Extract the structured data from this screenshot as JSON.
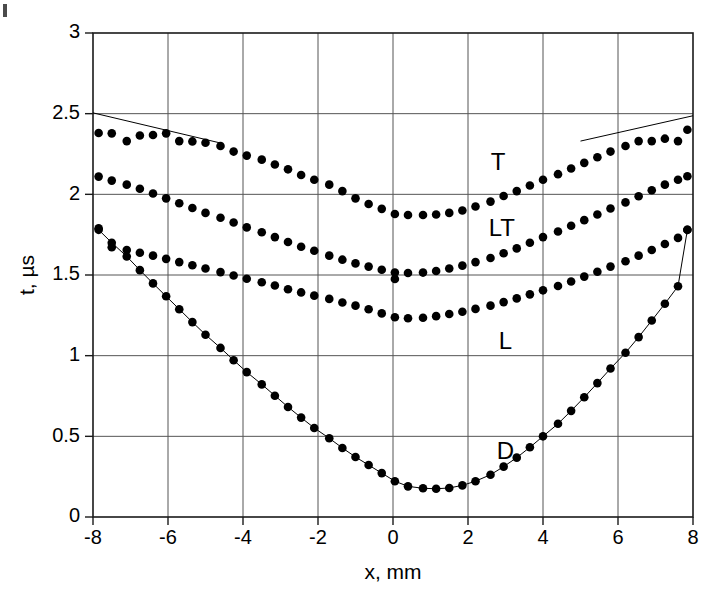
{
  "chart_data": {
    "type": "scatter",
    "title": "",
    "xlabel": "x, mm",
    "ylabel": "t, µs",
    "xlim": [
      -8,
      8
    ],
    "ylim": [
      0,
      3
    ],
    "xticks": [
      -8,
      -6,
      -4,
      -2,
      0,
      2,
      4,
      6,
      8
    ],
    "xtick_labels": [
      "-8",
      "-6",
      "-4",
      "-2",
      "0",
      "2",
      "4",
      "6",
      "8"
    ],
    "yticks": [
      0,
      0.5,
      1,
      1.5,
      2,
      2.5,
      3
    ],
    "ytick_labels": [
      "0",
      "0.5",
      "1",
      "1.5",
      "2",
      "2.5",
      "3"
    ],
    "grid": true,
    "legend": "none",
    "marker": "filled-circle",
    "marker_color": "#000000",
    "line_color": "#000000",
    "annotations": [
      {
        "text": "T",
        "x": 2.8,
        "y": 2.19
      },
      {
        "text": "LT",
        "x": 2.9,
        "y": 1.78
      },
      {
        "text": "L",
        "x": 3.0,
        "y": 1.08
      },
      {
        "text": "D",
        "x": 3.0,
        "y": 0.4
      }
    ],
    "series": [
      {
        "name": "T",
        "label": "T",
        "has_fit_line": true,
        "fit_line_segments": [
          {
            "x": [
              -8.0,
              -4.6
            ],
            "y": [
              2.505,
              2.318
            ]
          },
          {
            "x": [
              5.0,
              8.0
            ],
            "y": [
              2.33,
              2.487
            ]
          }
        ],
        "x": [
          -7.85,
          -7.5,
          -7.1,
          -6.75,
          -6.4,
          -6.05,
          -5.7,
          -5.35,
          -5.0,
          -4.6,
          -4.25,
          -3.9,
          -3.5,
          -3.15,
          -2.8,
          -2.45,
          -2.1,
          -1.7,
          -1.35,
          -1.0,
          -0.65,
          -0.3,
          0.05,
          0.4,
          0.8,
          1.15,
          1.5,
          1.85,
          2.2,
          2.6,
          2.95,
          3.3,
          3.65,
          4.0,
          4.4,
          4.75,
          5.1,
          5.45,
          5.8,
          6.2,
          6.55,
          6.9,
          7.25,
          7.6,
          7.85
        ],
        "y": [
          2.38,
          2.378,
          2.33,
          2.365,
          2.368,
          2.378,
          2.33,
          2.328,
          2.32,
          2.3,
          2.265,
          2.24,
          2.215,
          2.185,
          2.155,
          2.12,
          2.09,
          2.06,
          2.02,
          1.975,
          1.94,
          1.91,
          1.878,
          1.872,
          1.872,
          1.875,
          1.885,
          1.9,
          1.925,
          1.955,
          1.99,
          2.02,
          2.055,
          2.09,
          2.125,
          2.16,
          2.195,
          2.23,
          2.265,
          2.3,
          2.33,
          2.33,
          2.345,
          2.33,
          2.4
        ]
      },
      {
        "name": "LT",
        "label": "LT",
        "has_fit_line": false,
        "x": [
          -7.85,
          -7.5,
          -7.1,
          -6.75,
          -6.4,
          -6.05,
          -5.7,
          -5.35,
          -5.0,
          -4.6,
          -4.25,
          -3.9,
          -3.5,
          -3.15,
          -2.8,
          -2.45,
          -2.1,
          -1.7,
          -1.35,
          -1.0,
          -0.65,
          -0.3,
          0.05,
          0.4,
          0.8,
          1.15,
          1.5,
          1.85,
          2.2,
          2.6,
          2.95,
          3.3,
          3.65,
          4.0,
          4.4,
          4.75,
          5.1,
          5.45,
          5.8,
          6.2,
          6.55,
          6.9,
          7.25,
          7.6,
          7.85
        ],
        "y": [
          2.11,
          2.085,
          2.06,
          2.035,
          2.005,
          1.975,
          1.945,
          1.915,
          1.885,
          1.855,
          1.825,
          1.795,
          1.765,
          1.735,
          1.705,
          1.675,
          1.65,
          1.62,
          1.595,
          1.572,
          1.552,
          1.533,
          1.515,
          1.512,
          1.515,
          1.525,
          1.54,
          1.558,
          1.58,
          1.605,
          1.635,
          1.665,
          1.7,
          1.735,
          1.77,
          1.805,
          1.84,
          1.875,
          1.912,
          1.95,
          1.988,
          2.025,
          2.06,
          2.09,
          2.112
        ],
        "outlier_points": [
          {
            "x": 0.05,
            "y": 1.475
          }
        ]
      },
      {
        "name": "L",
        "label": "L",
        "has_fit_line": false,
        "x": [
          -7.85,
          -7.5,
          -7.1,
          -6.75,
          -6.4,
          -6.05,
          -5.7,
          -5.35,
          -5.0,
          -4.6,
          -4.25,
          -3.9,
          -3.5,
          -3.15,
          -2.8,
          -2.45,
          -2.1,
          -1.7,
          -1.35,
          -1.0,
          -0.65,
          -0.3,
          0.05,
          0.4,
          0.8,
          1.15,
          1.5,
          1.85,
          2.2,
          2.6,
          2.95,
          3.3,
          3.65,
          4.0,
          4.4,
          4.75,
          5.1,
          5.45,
          5.8,
          6.2,
          6.55,
          6.9,
          7.25,
          7.6,
          7.85
        ],
        "y": [
          1.79,
          1.672,
          1.655,
          1.638,
          1.62,
          1.6,
          1.58,
          1.56,
          1.54,
          1.518,
          1.497,
          1.477,
          1.455,
          1.435,
          1.412,
          1.392,
          1.372,
          1.352,
          1.33,
          1.31,
          1.288,
          1.262,
          1.238,
          1.232,
          1.235,
          1.245,
          1.258,
          1.272,
          1.29,
          1.31,
          1.332,
          1.355,
          1.38,
          1.405,
          1.432,
          1.46,
          1.49,
          1.52,
          1.552,
          1.585,
          1.62,
          1.655,
          1.692,
          1.73,
          1.78
        ]
      },
      {
        "name": "D",
        "label": "D",
        "has_fit_line": true,
        "fit_line_through_points": true,
        "x": [
          -7.85,
          -7.5,
          -7.1,
          -6.75,
          -6.4,
          -6.05,
          -5.7,
          -5.35,
          -5.0,
          -4.6,
          -4.25,
          -3.9,
          -3.5,
          -3.15,
          -2.8,
          -2.45,
          -2.1,
          -1.7,
          -1.35,
          -1.0,
          -0.65,
          -0.3,
          0.05,
          0.4,
          0.8,
          1.15,
          1.5,
          1.85,
          2.2,
          2.6,
          2.95,
          3.3,
          3.65,
          4.0,
          4.4,
          4.75,
          5.1,
          5.45,
          5.8,
          6.2,
          6.55,
          6.9,
          7.25,
          7.6,
          7.85
        ],
        "y": [
          1.78,
          1.7,
          1.615,
          1.53,
          1.448,
          1.368,
          1.288,
          1.208,
          1.13,
          1.048,
          0.972,
          0.898,
          0.822,
          0.752,
          0.682,
          0.616,
          0.552,
          0.488,
          0.428,
          0.372,
          0.322,
          0.272,
          0.222,
          0.19,
          0.178,
          0.175,
          0.18,
          0.196,
          0.222,
          0.262,
          0.312,
          0.368,
          0.432,
          0.5,
          0.578,
          0.658,
          0.742,
          0.83,
          0.92,
          1.018,
          1.115,
          1.218,
          1.322,
          1.43,
          1.78
        ]
      }
    ]
  },
  "figure": {
    "background": "#ffffff",
    "axis_color": "#1a1a1a",
    "grid_color": "#555555"
  }
}
